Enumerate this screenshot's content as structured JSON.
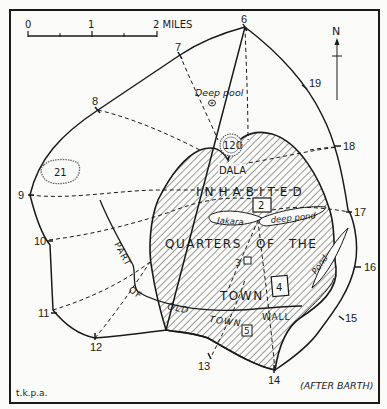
{
  "map": {
    "title": "Kano old city walls and gates",
    "credit_left": "t.k.p.a.",
    "credit_right": "(AFTER BARTH)",
    "north_label": "N",
    "scale": {
      "ticks": [
        "0",
        "1",
        "2 MILES"
      ]
    },
    "region_labels": {
      "inhabited": "INHABITED",
      "quarters": "QUARTERS",
      "of": "OF",
      "the": "THE",
      "town": "TOWN",
      "dala": "DALA",
      "part": "PART",
      "part_of": "OF",
      "old": "OLD",
      "old_town": "TOWN",
      "wall": "WALL"
    },
    "water_labels": {
      "deep_pool": "Deep pool",
      "jakara": "Jakara",
      "deep_pond": "deep pond",
      "pond": "Pond"
    },
    "gates": [
      "6",
      "7",
      "8",
      "9",
      "10",
      "11",
      "12",
      "13",
      "14",
      "15",
      "16",
      "17",
      "18",
      "19"
    ],
    "landmarks": {
      "hill_dala": "120",
      "hill_west": "21",
      "site_2": "2",
      "site_3": "3",
      "site_4": "4",
      "site_5": "5"
    },
    "colors": {
      "ink": "#1a1a1a",
      "paper": "#fbfbf9",
      "hatch": "#3a3a3a"
    }
  }
}
